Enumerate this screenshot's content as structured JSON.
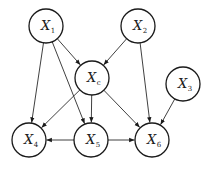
{
  "diagram": {
    "type": "directed-graph",
    "node_radius": 17,
    "nodes": [
      {
        "id": "X1",
        "var": "X",
        "sub": "1",
        "cx": 46,
        "cy": 26
      },
      {
        "id": "X2",
        "var": "X",
        "sub": "2",
        "cx": 138,
        "cy": 26
      },
      {
        "id": "Xc",
        "var": "X",
        "sub": "c",
        "cx": 92,
        "cy": 78
      },
      {
        "id": "X3",
        "var": "X",
        "sub": "3",
        "cx": 183,
        "cy": 84
      },
      {
        "id": "X4",
        "var": "X",
        "sub": "4",
        "cx": 29,
        "cy": 140
      },
      {
        "id": "X5",
        "var": "X",
        "sub": "5",
        "cx": 91,
        "cy": 140
      },
      {
        "id": "X6",
        "var": "X",
        "sub": "6",
        "cx": 152,
        "cy": 140
      }
    ],
    "edges": [
      {
        "from": "X1",
        "to": "Xc"
      },
      {
        "from": "X2",
        "to": "Xc"
      },
      {
        "from": "X1",
        "to": "X4"
      },
      {
        "from": "X1",
        "to": "X5"
      },
      {
        "from": "X2",
        "to": "X6"
      },
      {
        "from": "Xc",
        "to": "X4"
      },
      {
        "from": "Xc",
        "to": "X5"
      },
      {
        "from": "Xc",
        "to": "X6"
      },
      {
        "from": "X3",
        "to": "X6"
      },
      {
        "from": "X5",
        "to": "X4"
      },
      {
        "from": "X5",
        "to": "X6"
      }
    ],
    "colors": {
      "stroke": "#1a1a1a",
      "background": "#ffffff"
    }
  }
}
